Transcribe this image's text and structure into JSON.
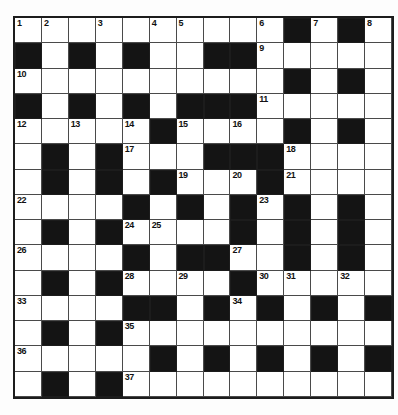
{
  "puzzle": {
    "type": "crossword",
    "cols": 14,
    "rows": [
      [
        "1",
        "2",
        "",
        "3",
        "",
        "4",
        "5",
        "",
        "",
        "6",
        "#",
        "7",
        "#",
        "8"
      ],
      [
        "#",
        "",
        "#",
        "",
        "#",
        "",
        "",
        "#",
        "#",
        "9",
        "",
        "",
        "",
        ""
      ],
      [
        "10",
        "",
        "",
        "",
        "",
        "",
        "",
        "",
        "",
        "",
        "#",
        "",
        "#",
        ""
      ],
      [
        "#",
        "",
        "#",
        "",
        "#",
        "",
        "#",
        "#",
        "#",
        "11",
        "",
        "",
        "",
        ""
      ],
      [
        "12",
        "",
        "13",
        "",
        "14",
        "#",
        "15",
        "",
        "16",
        "",
        "#",
        "",
        "#",
        ""
      ],
      [
        "",
        "#",
        "",
        "#",
        "17",
        "",
        "",
        "#",
        "#",
        "#",
        "18",
        "",
        "",
        ""
      ],
      [
        "",
        "#",
        "",
        "#",
        "",
        "#",
        "19",
        "",
        "20",
        "#",
        "21",
        "",
        "",
        ""
      ],
      [
        "22",
        "",
        "",
        "",
        "#",
        "",
        "#",
        "",
        "#",
        "23",
        "#",
        "",
        "#",
        ""
      ],
      [
        "",
        "#",
        "",
        "#",
        "24",
        "25",
        "",
        "",
        "#",
        "",
        "#",
        "",
        "#",
        ""
      ],
      [
        "26",
        "",
        "",
        "",
        "#",
        "",
        "#",
        "#",
        "27",
        "",
        "#",
        "",
        "#",
        ""
      ],
      [
        "",
        "#",
        "",
        "#",
        "28",
        "",
        "29",
        "",
        "#",
        "30",
        "31",
        "",
        "32",
        ""
      ],
      [
        "33",
        "",
        "",
        "",
        "#",
        "#",
        "",
        "#",
        "34",
        "#",
        "",
        "#",
        "",
        "#"
      ],
      [
        "",
        "#",
        "",
        "#",
        "35",
        "",
        "",
        "",
        "",
        "",
        "",
        "",
        "",
        ""
      ],
      [
        "36",
        "",
        "",
        "",
        "",
        "#",
        "",
        "#",
        "",
        "#",
        "",
        "#",
        "",
        "#"
      ],
      [
        "",
        "#",
        "",
        "#",
        "37",
        "",
        "",
        "",
        "",
        "",
        "",
        "",
        "",
        ""
      ]
    ],
    "colors": {
      "black_cell": "#141414",
      "grid_line": "#4a4a4a",
      "border": "#1c1c1c",
      "number": "#111111",
      "background": "#ffffff"
    },
    "numbers_visible": [
      "1",
      "2",
      "3",
      "4",
      "5",
      "6",
      "7",
      "8",
      "9",
      "10",
      "11",
      "12",
      "13",
      "14",
      "15",
      "16",
      "17",
      "18",
      "19",
      "20",
      "21",
      "22",
      "23",
      "24",
      "25",
      "26",
      "27",
      "28",
      "29",
      "30",
      "31",
      "32",
      "33",
      "34",
      "35",
      "36",
      "37"
    ]
  }
}
